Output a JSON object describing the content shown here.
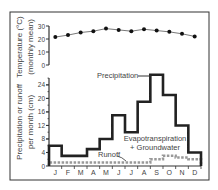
{
  "chart_data": [
    {
      "type": "line",
      "title": "",
      "xlabel": "",
      "ylabel": "Temperature (°C) (monthly mean)",
      "ylabel_lines": [
        "Temperature (°C)",
        "(monthly mean)"
      ],
      "categories": [
        "J",
        "F",
        "M",
        "A",
        "M",
        "J",
        "J",
        "A",
        "S",
        "O",
        "N",
        "D"
      ],
      "yticks": [
        0,
        10,
        20,
        30
      ],
      "ylim": [
        0,
        30
      ],
      "grid": false,
      "series": [
        {
          "name": "Temperature",
          "values": [
            21.5,
            23,
            25,
            26,
            28,
            27,
            26,
            27.5,
            26.5,
            25.5,
            24,
            22
          ]
        }
      ]
    },
    {
      "type": "line",
      "subtype": "step",
      "title": "",
      "xlabel": "",
      "ylabel": "Precipitation or runoff per month (cm)",
      "ylabel_lines": [
        "Precipitation or runoff",
        "per month (cm)"
      ],
      "categories": [
        "J",
        "F",
        "M",
        "A",
        "M",
        "J",
        "J",
        "A",
        "S",
        "O",
        "N",
        "D"
      ],
      "yticks": [
        0,
        4,
        8,
        12,
        16,
        20,
        24
      ],
      "ylim": [
        0,
        28
      ],
      "grid": false,
      "series": [
        {
          "name": "Precipitation",
          "values": [
            6,
            3,
            3,
            5,
            8,
            15,
            10,
            19,
            27,
            21,
            12,
            4
          ]
        },
        {
          "name": "Runoff",
          "values": [
            1,
            1,
            1,
            1,
            1,
            1,
            1,
            1,
            2,
            3,
            2.5,
            2
          ]
        }
      ],
      "annotations": [
        {
          "text": "Precipitation",
          "target": "Precipitation"
        },
        {
          "text": "Evapotranspiration",
          "line2": "+ Groundwater",
          "region": "between precipitation and runoff"
        },
        {
          "text": "Runoff",
          "target": "Runoff"
        }
      ]
    }
  ],
  "labels": {
    "temp_axis_line1": "Temperature (°C)",
    "temp_axis_line2": "(monthly mean)",
    "precip_axis_line1": "Precipitation or runoff",
    "precip_axis_line2": "per month (cm)",
    "precip_annotation": "Precipitation",
    "et_annotation_line1": "Evapotranspiration",
    "et_annotation_line2": "+ Groundwater",
    "runoff_annotation": "Runoff"
  },
  "colors": {
    "frame": "#333333",
    "precip_line": "#222222",
    "temp_line": "#555555",
    "runoff_line": "#999999",
    "text": "#444444"
  }
}
